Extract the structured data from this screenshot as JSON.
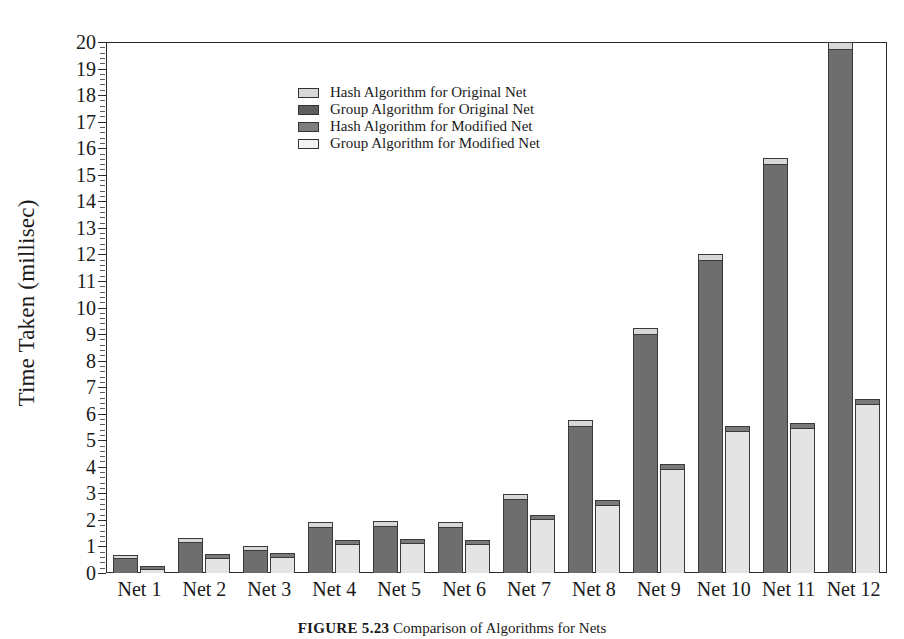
{
  "chart_data": {
    "type": "bar",
    "title": "",
    "xlabel": "",
    "ylabel": "Time Taken (millisec)",
    "ylim": [
      0,
      20
    ],
    "ytick_step": 1,
    "grid": false,
    "legend_position": "upper-center",
    "stacked": true,
    "categories": [
      "Net 1",
      "Net 2",
      "Net 3",
      "Net 4",
      "Net 5",
      "Net 6",
      "Net 7",
      "Net 8",
      "Net 9",
      "Net 10",
      "Net 11",
      "Net 12"
    ],
    "ytick_labels": [
      "0",
      "1",
      "2",
      "3",
      "4",
      "5",
      "6",
      "7",
      "8",
      "9",
      "10",
      "11",
      "12",
      "13",
      "14",
      "15",
      "16",
      "17",
      "18",
      "19",
      "20"
    ],
    "series": [
      {
        "name": "Group Algorithm for Original Net",
        "color": "#6e6e6e",
        "stack": "original",
        "values": [
          0.55,
          1.15,
          0.85,
          1.75,
          1.78,
          1.75,
          2.8,
          5.55,
          9.0,
          11.8,
          15.4,
          19.75
        ]
      },
      {
        "name": "Hash Algorithm for Original Net",
        "color": "#d8d8d8",
        "stack": "original",
        "values": [
          0.12,
          0.18,
          0.15,
          0.18,
          0.17,
          0.18,
          0.18,
          0.22,
          0.22,
          0.22,
          0.22,
          0.25
        ]
      },
      {
        "name": "Group Algorithm for Modified Net",
        "color": "#e4e4e4",
        "stack": "modified",
        "values": [
          0.15,
          0.55,
          0.62,
          1.1,
          1.12,
          1.1,
          2.05,
          2.58,
          3.92,
          5.35,
          5.45,
          6.35
        ]
      },
      {
        "name": "Hash Algorithm for Modified Net",
        "color": "#7a7a7a",
        "stack": "modified",
        "values": [
          0.12,
          0.15,
          0.15,
          0.15,
          0.15,
          0.15,
          0.15,
          0.18,
          0.18,
          0.2,
          0.2,
          0.22
        ]
      }
    ],
    "totals_original": [
      0.67,
      1.33,
      1.0,
      1.93,
      1.95,
      1.93,
      2.98,
      5.77,
      9.22,
      12.02,
      15.62,
      20.0
    ],
    "totals_modified": [
      0.27,
      0.7,
      0.77,
      1.25,
      1.27,
      1.25,
      2.2,
      2.76,
      4.1,
      5.55,
      5.65,
      6.57
    ]
  },
  "legend": {
    "items": [
      {
        "label": "Hash Algorithm for Original Net",
        "swatch": "#d8d8d8"
      },
      {
        "label": "Group Algorithm for Original Net",
        "swatch": "#5e5e5e"
      },
      {
        "label": "Hash Algorithm for Modified Net",
        "swatch": "#7e7e7e"
      },
      {
        "label": "Group Algorithm for Modified Net",
        "swatch": "#f2f2f2"
      }
    ]
  },
  "caption": {
    "number": "FIGURE 5.23",
    "text": "Comparison of Algorithms for Nets"
  }
}
